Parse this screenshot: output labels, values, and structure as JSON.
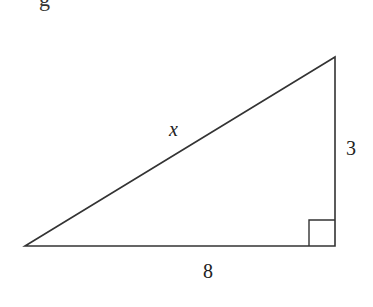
{
  "figure": {
    "cropped_text_fragment": "g",
    "triangle": {
      "type": "right-triangle",
      "vertices": {
        "left": [
          25,
          246
        ],
        "top_right": [
          335,
          57
        ],
        "bottom_right": [
          335,
          246
        ]
      },
      "right_angle_at": "bottom_right",
      "stroke_color": "#333333"
    },
    "labels": {
      "hypotenuse": "x",
      "vertical_leg": "3",
      "horizontal_leg": "8"
    }
  }
}
